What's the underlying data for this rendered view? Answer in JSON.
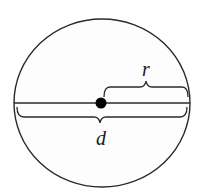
{
  "diagram": {
    "colors": {
      "stroke": "#2a2a2a",
      "background": "#ffffff",
      "fill": "#fdfdfd"
    },
    "circle": {
      "cx": 102,
      "cy": 103,
      "rx": 88,
      "ry": 84
    },
    "center_point": {
      "cx": 101,
      "cy": 103,
      "r": 5.5
    },
    "labels": {
      "radius": "r",
      "diameter": "d"
    }
  }
}
